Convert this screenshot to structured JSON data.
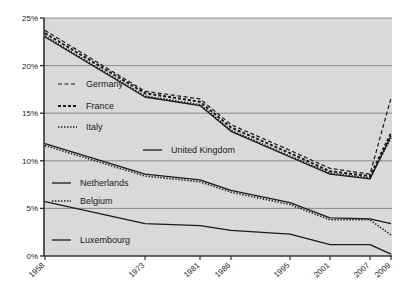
{
  "chart_data": {
    "type": "line",
    "title": "",
    "xlabel": "",
    "ylabel": "",
    "x": [
      1958,
      1973,
      1981,
      1986,
      1995,
      2001,
      2007,
      2009
    ],
    "xtick_labels": [
      "1958",
      "1973",
      "1981",
      "1986",
      "1995",
      "2001",
      "2007",
      "2009"
    ],
    "ytick_labels": [
      "0%",
      "5%",
      "10%",
      "15%",
      "20%",
      "25%"
    ],
    "ytick_values": [
      0,
      5,
      10,
      15,
      20,
      25
    ],
    "ylim": [
      0,
      25
    ],
    "xlim": [
      1958,
      2009
    ],
    "grid": true,
    "legend_position": "inside-left",
    "series": [
      {
        "name": "Germany",
        "style": "dashed",
        "values": [
          23.7,
          17.3,
          16.5,
          13.8,
          11.1,
          9.2,
          8.6,
          16.6
        ]
      },
      {
        "name": "France",
        "style": "thick-dashed",
        "values": [
          23.4,
          17.1,
          16.2,
          13.5,
          10.8,
          8.9,
          8.4,
          12.9
        ]
      },
      {
        "name": "Italy",
        "style": "dotted",
        "values": [
          23.1,
          16.8,
          15.9,
          13.2,
          10.5,
          8.7,
          8.2,
          12.4
        ]
      },
      {
        "name": "United Kingdom",
        "style": "solid",
        "values": [
          23.0,
          16.7,
          15.8,
          13.1,
          10.4,
          8.6,
          8.1,
          12.6
        ]
      },
      {
        "name": "Netherlands",
        "style": "solid",
        "values": [
          11.8,
          8.6,
          8.0,
          6.9,
          5.6,
          4.0,
          3.9,
          3.4
        ]
      },
      {
        "name": "Belgium",
        "style": "dotted",
        "values": [
          11.6,
          8.4,
          7.8,
          6.7,
          5.4,
          3.8,
          3.8,
          2.2
        ]
      },
      {
        "name": "Luxembourg",
        "style": "solid",
        "values": [
          5.7,
          3.4,
          3.2,
          2.7,
          2.3,
          1.2,
          1.2,
          0.2
        ]
      }
    ],
    "legend_entries": [
      {
        "label": "Germany",
        "style": "dashed"
      },
      {
        "label": "France",
        "style": "thick-dashed"
      },
      {
        "label": "Italy",
        "style": "dotted"
      },
      {
        "label": "United Kingdom",
        "style": "solid"
      },
      {
        "label": "Netherlands",
        "style": "solid"
      },
      {
        "label": "Belgium",
        "style": "dotted"
      },
      {
        "label": "Luxembourg",
        "style": "solid"
      }
    ],
    "colors": {
      "line": "#1a1a1a",
      "grid": "#808080",
      "plot_background": "#d9d9d9",
      "axis": "#333333",
      "page_background": "#ffffff"
    }
  }
}
